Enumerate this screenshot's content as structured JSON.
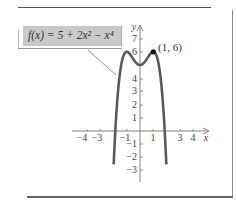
{
  "chart_data": {
    "type": "line",
    "title": "",
    "function_label": "f(x) = 5 + 2x² − x⁴",
    "xlabel": "x",
    "ylabel": "y",
    "x_ticks": [
      -4,
      -3,
      -1,
      1,
      3,
      4
    ],
    "y_ticks": [
      7,
      6,
      4,
      3,
      2,
      1,
      -1,
      -2,
      -3
    ],
    "xlim": [
      -4.5,
      4.5
    ],
    "ylim": [
      -3.8,
      7.5
    ],
    "grid": false,
    "series": [
      {
        "name": "f(x) = 5 + 2x^2 - x^4",
        "expression": "5 + 2*x^2 - x^4",
        "x": [
          -2.0,
          -1.9,
          -1.8,
          -1.6,
          -1.4,
          -1.2,
          -1.0,
          -0.8,
          -0.6,
          -0.4,
          -0.2,
          0,
          0.2,
          0.4,
          0.6,
          0.8,
          1.0,
          1.2,
          1.4,
          1.6,
          1.8,
          1.9,
          2.0
        ],
        "y": [
          -3,
          -1.81,
          -0.94,
          3.57,
          5.08,
          5.81,
          6,
          5.87,
          5.59,
          5.29,
          5.08,
          5,
          5.08,
          5.29,
          5.59,
          5.87,
          6,
          5.81,
          5.08,
          3.57,
          -0.94,
          -1.81,
          -3
        ]
      }
    ],
    "annotations": [
      {
        "label": "(1, 6)",
        "x": 1,
        "y": 6,
        "marker": "filled-dot"
      }
    ]
  },
  "labels": {
    "function": "f(x) = 5 + 2x² − x⁴",
    "point": "(1, 6)",
    "x_axis": "x",
    "y_axis": "y",
    "xt": {
      "m4": "−4",
      "m3": "−3",
      "m1": "−1",
      "p1": "1",
      "p3": "3",
      "p4": "4"
    },
    "yt": {
      "p7": "7",
      "p6": "6",
      "p4": "4",
      "p3": "3",
      "p2": "2",
      "p1": "1",
      "m1": "−1",
      "m2": "−2",
      "m3": "−3"
    }
  },
  "colors": {
    "curve": "#5a5a5a",
    "label_box": "#c9c9c9",
    "axis": "#777777"
  }
}
